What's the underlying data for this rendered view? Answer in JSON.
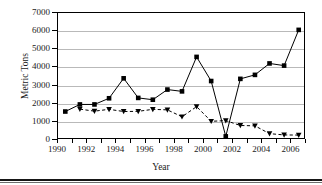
{
  "chart_data": {
    "type": "line",
    "title": "",
    "xlabel": "Year",
    "ylabel": "Metric Tons",
    "xlim": [
      1990,
      2007
    ],
    "ylim": [
      0,
      7000
    ],
    "grid": true,
    "legend": "none",
    "y_ticks": [
      0,
      1000,
      2000,
      3000,
      4000,
      5000,
      6000,
      7000
    ],
    "y_tick_labels": [
      "0",
      "1000",
      "2000",
      "3000",
      "4000",
      "5000",
      "6000",
      "7000"
    ],
    "x_ticks": [
      1990,
      1991,
      1992,
      1993,
      1994,
      1995,
      1996,
      1997,
      1998,
      1999,
      2000,
      2001,
      2002,
      2003,
      2004,
      2005,
      2006,
      2007
    ],
    "x_tick_labels_major": [
      "1990",
      "1992",
      "1994",
      "1996",
      "1998",
      "2000",
      "2002",
      "2004",
      "2006"
    ],
    "x_major_values": [
      1990,
      1992,
      1994,
      1996,
      1998,
      2000,
      2002,
      2004,
      2006
    ],
    "x": [
      1990.5,
      1991.5,
      1992.5,
      1993.5,
      1994.5,
      1995.5,
      1996.5,
      1997.5,
      1998.5,
      1999.5,
      2000.5,
      2001.5,
      2002.5,
      2003.5,
      2004.5,
      2005.5,
      2006.5
    ],
    "series": [
      {
        "name": "Series 1",
        "marker": "square",
        "linestyle": "solid",
        "color": "#000000",
        "x": [
          1990.5,
          1991.5,
          1992.5,
          1993.5,
          1994.5,
          1995.5,
          1996.5,
          1997.5,
          1998.5,
          1999.5,
          2000.5,
          2001.5,
          2002.5,
          2003.5,
          2004.5,
          2005.5,
          2006.5
        ],
        "values": [
          1570,
          1960,
          1960,
          2300,
          3400,
          2320,
          2220,
          2780,
          2680,
          4580,
          3250,
          200,
          3370,
          3590,
          4220,
          4100,
          6070
        ]
      },
      {
        "name": "Series 2",
        "marker": "triangle",
        "linestyle": "dashed",
        "color": "#000000",
        "x": [
          1991.5,
          1992.5,
          1993.5,
          1994.5,
          1995.5,
          1996.5,
          1997.5,
          1998.5,
          1999.5,
          2000.5,
          2001.5,
          2002.5,
          2003.5,
          2004.5,
          2005.5,
          2006.5
        ],
        "values": [
          1700,
          1590,
          1690,
          1570,
          1580,
          1690,
          1660,
          1280,
          1840,
          1030,
          1070,
          800,
          780,
          350,
          280,
          270
        ]
      }
    ]
  },
  "axis": {
    "y_title": "Metric Tons",
    "x_title": "Year"
  },
  "colors": {
    "grid": "#b9b9b9",
    "axis": "#000000",
    "series": "#000000",
    "background": "#ffffff"
  }
}
